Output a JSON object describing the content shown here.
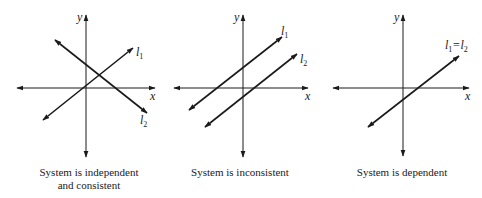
{
  "diagram": {
    "stroke_color": "#1a1a1a",
    "axis_labels": {
      "x": "x",
      "y": "y"
    },
    "panels": [
      {
        "id": "independent",
        "axes": {
          "origin": [
            86,
            88
          ],
          "x_left": 17,
          "x_right": 155,
          "y_top": 15,
          "y_bottom": 157
        },
        "lines": [
          {
            "name": "l1",
            "label": "l",
            "sub": "1",
            "from": [
              43,
              120
            ],
            "to": [
              133,
              48
            ],
            "label_pos": [
              137,
              55
            ]
          },
          {
            "name": "l2",
            "label": "l",
            "sub": "2",
            "from": [
              55,
              40
            ],
            "to": [
              147,
              113
            ],
            "label_pos": [
              141,
              124
            ]
          }
        ],
        "caption_lines": [
          "System is independent",
          "and consistent"
        ],
        "caption_center_x": 89
      },
      {
        "id": "inconsistent",
        "axes": {
          "origin": [
            243,
            88
          ],
          "x_left": 174,
          "x_right": 308,
          "y_top": 15,
          "y_bottom": 157
        },
        "lines": [
          {
            "name": "l1",
            "label": "l",
            "sub": "1",
            "from": [
              189,
              110
            ],
            "to": [
              282,
              37
            ],
            "label_pos": [
              282,
              35
            ]
          },
          {
            "name": "l2",
            "label": "l",
            "sub": "2",
            "from": [
              205,
              127
            ],
            "to": [
              297,
              54
            ],
            "label_pos": [
              301,
              64
            ]
          }
        ],
        "caption_lines": [
          "System is inconsistent"
        ],
        "caption_center_x": 240
      },
      {
        "id": "dependent",
        "axes": {
          "origin": [
            403,
            88
          ],
          "x_left": 333,
          "x_right": 469,
          "y_top": 15,
          "y_bottom": 156
        },
        "lines": [
          {
            "name": "l1=l2",
            "label": "l",
            "sub": "1",
            "from": [
              368,
              127
            ],
            "to": [
              459,
              56
            ],
            "label_pos": [
              446,
              50
            ]
          }
        ],
        "combined_label": {
          "l1": "l",
          "sub1": "1",
          "eq": "=",
          "l2": "l",
          "sub2": "2"
        },
        "caption_lines": [
          "System is dependent"
        ],
        "caption_center_x": 402
      }
    ]
  },
  "captions": {
    "independent_line1": "System is independent",
    "independent_line2": "and consistent",
    "inconsistent": "System is inconsistent",
    "dependent": "System is dependent"
  },
  "labels": {
    "x": "x",
    "y": "y",
    "l": "l",
    "sub1": "1",
    "sub2": "2",
    "eq": "="
  }
}
